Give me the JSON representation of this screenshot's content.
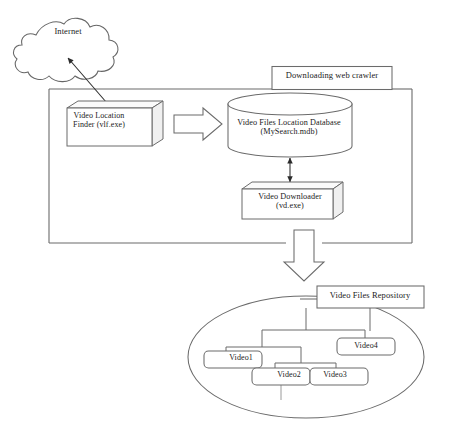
{
  "diagram": {
    "title_text_present": false,
    "cloud": {
      "label": "Internet",
      "name": "internet-cloud"
    },
    "system_boundary": {
      "label": "Downloading web crawler"
    },
    "components": [
      {
        "id": "vlf",
        "label": "Video Location\nFinder (vlf.exe)",
        "shape": "3d-box"
      },
      {
        "id": "database",
        "label": "Video Files Location Database\n(MySearch.mdb)",
        "shape": "cylinder"
      },
      {
        "id": "downloader",
        "label": "Video Downloader\n(vd.exe)",
        "shape": "3d-box"
      }
    ],
    "repository": {
      "label": "Video Files Repository",
      "shape": "ellipse",
      "files": [
        {
          "id": "video1",
          "label": "Video1"
        },
        {
          "id": "video2",
          "label": "Video2"
        },
        {
          "id": "video3",
          "label": "Video3"
        },
        {
          "id": "video4",
          "label": "Video4"
        }
      ]
    },
    "connectors": [
      {
        "from": "internet-cloud",
        "to": "vlf",
        "style": "double-headed-thin-arrow"
      },
      {
        "from": "vlf",
        "to": "database",
        "style": "block-arrow-right"
      },
      {
        "from": "database",
        "to": "downloader",
        "style": "double-headed-thin-arrow"
      },
      {
        "from": "system-boundary",
        "to": "repository",
        "style": "block-arrow-down"
      }
    ],
    "colors": {
      "stroke": "#555555",
      "text": "#1a1a1a",
      "fill": "#ffffff",
      "shade": "#f2f2f2"
    }
  }
}
